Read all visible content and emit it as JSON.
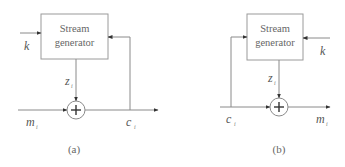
{
  "diagrams": [
    {
      "id": "a",
      "caption": "(a)",
      "block_label_line1": "Stream",
      "block_label_line2": "generator",
      "key_input": "k",
      "keystream": "z",
      "keystream_sub": "i",
      "input": "m",
      "input_sub": "i",
      "output": "c",
      "output_sub": "i",
      "operator": "+",
      "feedback": "output c_i fed back to stream generator"
    },
    {
      "id": "b",
      "caption": "(b)",
      "block_label_line1": "Stream",
      "block_label_line2": "generator",
      "key_input": "k",
      "keystream": "z",
      "keystream_sub": "i",
      "input": "c",
      "input_sub": "i",
      "output": "m",
      "output_sub": "i",
      "operator": "+",
      "feedback": "input c_i fed forward to stream generator"
    }
  ],
  "colors": {
    "line": "#8a8a8a",
    "box_border": "#9a9a9a",
    "text": "#666666"
  }
}
